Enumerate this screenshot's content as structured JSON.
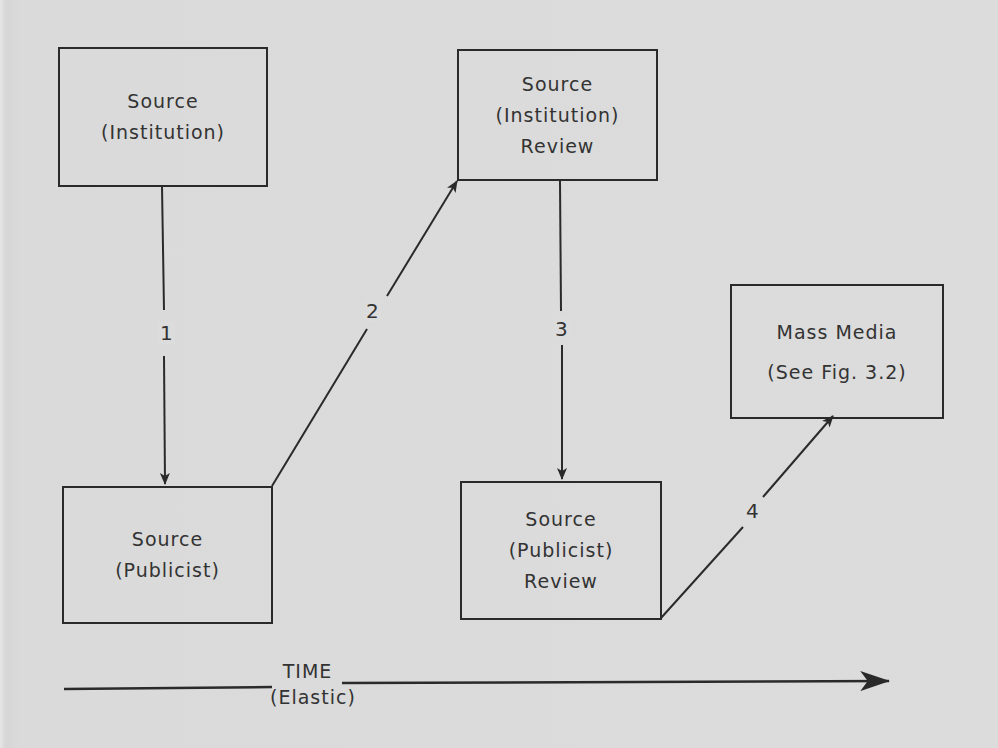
{
  "diagram": {
    "nodes": [
      {
        "id": "source-institution",
        "lines": [
          "Source",
          "(Institution)"
        ]
      },
      {
        "id": "source-institution-review",
        "lines": [
          "Source",
          "(Institution)",
          "Review"
        ]
      },
      {
        "id": "mass-media",
        "lines": [
          "Mass Media",
          "(See Fig.  3.2)"
        ]
      },
      {
        "id": "source-publicist",
        "lines": [
          "Source",
          "(Publicist)"
        ]
      },
      {
        "id": "source-publicist-review",
        "lines": [
          "Source",
          "(Publicist)",
          "Review"
        ]
      }
    ],
    "edges": [
      {
        "label": "1",
        "from": "source-institution",
        "to": "source-publicist"
      },
      {
        "label": "2",
        "from": "source-publicist",
        "to": "source-institution-review"
      },
      {
        "label": "3",
        "from": "source-institution-review",
        "to": "source-publicist-review"
      },
      {
        "label": "4",
        "from": "source-publicist-review",
        "to": "mass-media"
      }
    ],
    "time_axis": {
      "title": "TIME",
      "subtitle": "(Elastic)"
    }
  }
}
